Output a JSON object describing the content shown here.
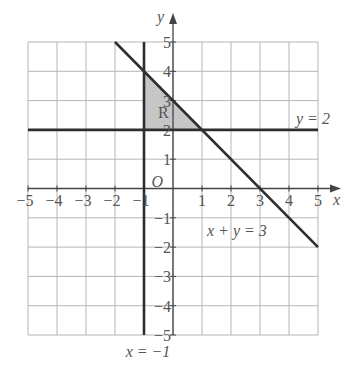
{
  "diagram": {
    "type": "coordinate-plane-inequality-region",
    "x_range": [
      -5,
      5
    ],
    "y_range": [
      -5,
      5
    ],
    "axes": {
      "x_label": "x",
      "y_label": "y",
      "origin_label": "O"
    },
    "x_ticks": [
      "-5",
      "-4",
      "-3",
      "-2",
      "-1",
      "1",
      "2",
      "3",
      "4",
      "5"
    ],
    "y_ticks": [
      "5",
      "4",
      "3",
      "2",
      "1",
      "-1",
      "-2",
      "-3",
      "-4",
      "-5"
    ],
    "lines": [
      {
        "id": "line-y2",
        "label": "y = 2",
        "from": [
          -5,
          2
        ],
        "to": [
          5,
          2
        ]
      },
      {
        "id": "line-xm1",
        "label": "x = −1",
        "from": [
          -1,
          5
        ],
        "to": [
          -1,
          -5
        ]
      },
      {
        "id": "line-xy3",
        "label": "x + y = 3",
        "from": [
          -2,
          5
        ],
        "to": [
          5,
          -2
        ]
      }
    ],
    "region": {
      "label": "R",
      "vertices": [
        [
          -1,
          4
        ],
        [
          -1,
          2
        ],
        [
          1,
          2
        ]
      ],
      "fill": "#c6c6c6"
    },
    "colors": {
      "grid": "#b5b5b5",
      "axis": "#444444",
      "line": "#2e2e2e",
      "text": "#555555"
    }
  }
}
